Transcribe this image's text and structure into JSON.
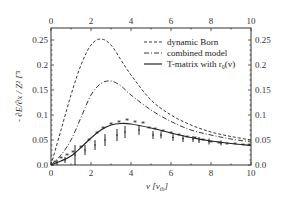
{
  "chart_data": {
    "type": "line",
    "title": "",
    "xlabel": "v   [v_th]",
    "ylabel": "- ∂E/∂x / Z² Γ³",
    "xlim": [
      0,
      10
    ],
    "ylim": [
      0,
      0.27
    ],
    "x_ticks": [
      "0",
      "2",
      "4",
      "6",
      "8",
      "10"
    ],
    "y_ticks": [
      "0.0",
      "0.05",
      "0.1",
      "0.15",
      "0.2",
      "0.25"
    ],
    "grid": false,
    "legend_position": "upper right",
    "series": [
      {
        "name": "dynamic Born",
        "style": "dashed",
        "x": [
          0,
          0.5,
          1,
          1.5,
          2,
          2.5,
          3,
          3.5,
          4,
          5,
          6,
          7,
          8,
          9,
          10
        ],
        "y": [
          0,
          0.07,
          0.14,
          0.2,
          0.24,
          0.252,
          0.24,
          0.21,
          0.18,
          0.13,
          0.1,
          0.08,
          0.066,
          0.057,
          0.05
        ]
      },
      {
        "name": "combined model",
        "style": "dash-dot",
        "x": [
          0,
          0.5,
          1,
          1.5,
          2,
          2.5,
          3,
          3.5,
          4,
          5,
          6,
          7,
          8,
          9,
          10
        ],
        "y": [
          0,
          0.02,
          0.05,
          0.095,
          0.14,
          0.163,
          0.168,
          0.158,
          0.14,
          0.11,
          0.087,
          0.07,
          0.06,
          0.052,
          0.046
        ]
      },
      {
        "name": "T-matrix with r0(v)",
        "style": "solid",
        "x": [
          0,
          0.5,
          1,
          1.5,
          2,
          2.5,
          3,
          3.5,
          4,
          5,
          6,
          7,
          8,
          9,
          10
        ],
        "y": [
          0,
          0.008,
          0.018,
          0.035,
          0.054,
          0.07,
          0.08,
          0.083,
          0.082,
          0.074,
          0.064,
          0.055,
          0.048,
          0.043,
          0.039
        ]
      },
      {
        "name": "simulation (stars)",
        "style": "markers-star",
        "x": [
          0.2,
          0.5,
          0.8,
          1.1,
          1.5,
          1.9,
          2.3,
          2.6,
          3.0,
          3.4,
          3.8,
          4.2,
          4.6,
          4.9,
          5.2,
          5.6,
          6.0,
          6.4,
          6.8,
          7.2,
          7.6,
          8.0,
          8.4,
          8.8,
          9.2,
          9.6,
          9.9
        ],
        "y": [
          0.005,
          0.012,
          0.018,
          0.025,
          0.035,
          0.048,
          0.062,
          0.072,
          0.08,
          0.085,
          0.088,
          0.085,
          0.082,
          0.072,
          0.07,
          0.066,
          0.062,
          0.058,
          0.055,
          0.052,
          0.048,
          0.045,
          0.043,
          0.041,
          0.04,
          0.039,
          0.038
        ]
      },
      {
        "name": "simulation (error bars)",
        "style": "error-bars",
        "x": [
          0.3,
          0.7,
          1.2,
          1.7,
          2.2,
          2.7,
          3.3,
          3.7,
          4.4,
          5.1,
          5.5,
          6.1,
          6.6,
          7.1,
          7.4,
          7.9,
          8.5
        ],
        "y": [
          0.005,
          0.01,
          0.02,
          0.03,
          0.04,
          0.05,
          0.06,
          0.066,
          0.07,
          0.06,
          0.06,
          0.055,
          0.053,
          0.052,
          0.05,
          0.047,
          0.044
        ],
        "err": [
          0.005,
          0.006,
          0.02,
          0.01,
          0.01,
          0.012,
          0.012,
          0.012,
          0.01,
          0.008,
          0.007,
          0.007,
          0.007,
          0.006,
          0.006,
          0.006,
          0.005
        ]
      }
    ]
  },
  "legend": {
    "items": [
      {
        "label": "dynamic Born",
        "style": "dashed"
      },
      {
        "label": "combined model",
        "style": "dash-dot"
      },
      {
        "label": "T-matrix with r₀(v)",
        "style": "solid"
      }
    ]
  },
  "axes": {
    "xlabel_v": "v",
    "xlabel_unit": "[v",
    "xlabel_sub": "th",
    "xlabel_close": "]",
    "ylabel": "- ∂E/∂x / Z² Γ³"
  }
}
